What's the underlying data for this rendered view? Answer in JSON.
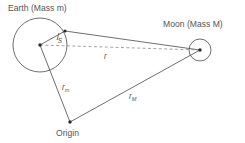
{
  "figure": {
    "background_color": "#ffffff",
    "line_color": "#4a4a4a",
    "dashed_color": "#8a8a8a",
    "text_color": "#555555",
    "width": 245,
    "height": 143
  },
  "labels": {
    "earth": "Earth (Mass m)",
    "moon": "Moon (Mass M)",
    "origin": "Origin",
    "radius_s": "s",
    "separation_r": "r",
    "vector_rm_base": "r",
    "vector_rm_sub": "m",
    "vector_rM_base": "r",
    "vector_rM_sub": "M"
  },
  "bodies": [
    {
      "name": "earth",
      "label": "Earth (Mass m)",
      "mass_symbol": "m",
      "center": [
        40,
        45
      ],
      "radius": 27
    },
    {
      "name": "moon",
      "label": "Moon (Mass M)",
      "mass_symbol": "M",
      "center": [
        200,
        50
      ],
      "radius": 11
    }
  ],
  "points": {
    "earth_center": [
      40,
      45
    ],
    "moon_center": [
      200,
      50
    ],
    "origin": [
      70,
      122
    ],
    "earth_surface": [
      65,
      31
    ]
  },
  "segments": [
    {
      "name": "earth-radius-s",
      "label": "s",
      "from": "earth_center",
      "to": "earth_surface",
      "style": "solid"
    },
    {
      "name": "surface-to-moon",
      "label": "",
      "from": "earth_surface",
      "to": "moon_center",
      "style": "solid"
    },
    {
      "name": "center-separation-r",
      "label": "r",
      "from": "earth_center",
      "to": "moon_center",
      "style": "dashed"
    },
    {
      "name": "origin-to-earth",
      "label": "r_m",
      "from": "origin",
      "to": "earth_center",
      "style": "solid"
    },
    {
      "name": "origin-to-moon",
      "label": "r_M",
      "from": "origin",
      "to": "moon_center",
      "style": "solid"
    }
  ]
}
